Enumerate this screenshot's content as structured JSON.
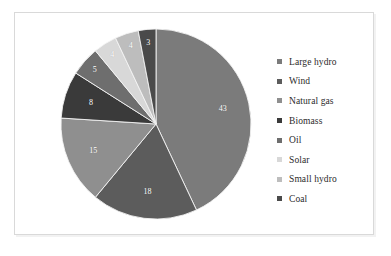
{
  "chart_data": {
    "type": "pie",
    "title": "",
    "labels": [
      "Large hydro",
      "Wind",
      "Natural gas",
      "Biomass",
      "Oil",
      "Solar",
      "Small hydro",
      "Coal"
    ],
    "values": [
      43,
      18,
      15,
      8,
      5,
      4,
      4,
      3
    ],
    "value_labels": [
      "43",
      "18",
      "15",
      "8",
      "5",
      "4",
      "4",
      "3"
    ],
    "colors": [
      "#7b7b7b",
      "#5c5c5c",
      "#8f8f8f",
      "#3a3a3a",
      "#6e6e6e",
      "#d8d8d8",
      "#bdbdbd",
      "#4a4a4a"
    ],
    "units": "percent",
    "total": 100,
    "start_angle_deg": 0,
    "direction": "clockwise",
    "legend_position": "right",
    "grid": false,
    "xlabel": "",
    "ylabel": ""
  },
  "legend": {
    "items": [
      {
        "label": "Large hydro",
        "color": "#7b7b7b"
      },
      {
        "label": "Wind",
        "color": "#5c5c5c"
      },
      {
        "label": "Natural gas",
        "color": "#8f8f8f"
      },
      {
        "label": "Biomass",
        "color": "#3a3a3a"
      },
      {
        "label": "Oil",
        "color": "#6e6e6e"
      },
      {
        "label": "Solar",
        "color": "#d8d8d8"
      },
      {
        "label": "Small hydro",
        "color": "#bdbdbd"
      },
      {
        "label": "Coal",
        "color": "#4a4a4a"
      }
    ]
  }
}
